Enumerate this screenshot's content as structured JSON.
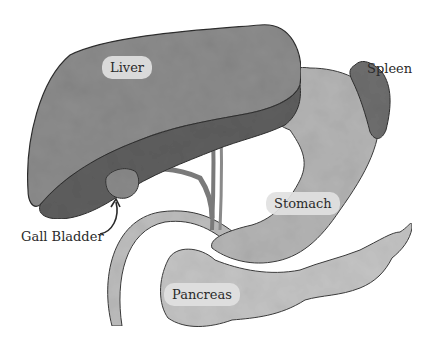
{
  "diagram": {
    "labels": [
      {
        "id": "liver",
        "text": "Liver"
      },
      {
        "id": "spleen",
        "text": "Spleen"
      },
      {
        "id": "gall_bladder",
        "text": "Gall Bladder"
      },
      {
        "id": "stomach",
        "text": "Stomach"
      },
      {
        "id": "pancreas",
        "text": "Pancreas"
      }
    ],
    "colors": {
      "liver_light": "#8c8c8c",
      "liver_dark": "#5e5e5e",
      "stomach": "#b4b4b4",
      "pancreas": "#c4c4c4",
      "spleen": "#6e6e6e",
      "gall_bladder": "#8a8a8a",
      "outline": "#3a3a3a",
      "label_bg": "#e1e1e1",
      "text": "#2a2a2a"
    }
  }
}
